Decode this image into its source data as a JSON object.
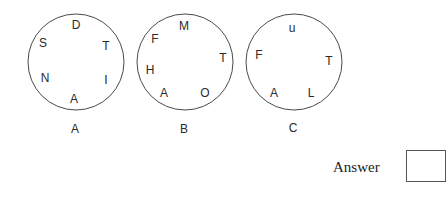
{
  "circles": [
    {
      "label": "A",
      "letters": [
        "D",
        "T",
        "I",
        "A",
        "N",
        "S"
      ]
    },
    {
      "label": "B",
      "letters": [
        "M",
        "T",
        "O",
        "A",
        "H",
        "F"
      ]
    },
    {
      "label": "C",
      "letters": [
        "u",
        "T",
        "L",
        "A",
        "F"
      ]
    }
  ],
  "answer": {
    "label": "Answer",
    "value": ""
  }
}
